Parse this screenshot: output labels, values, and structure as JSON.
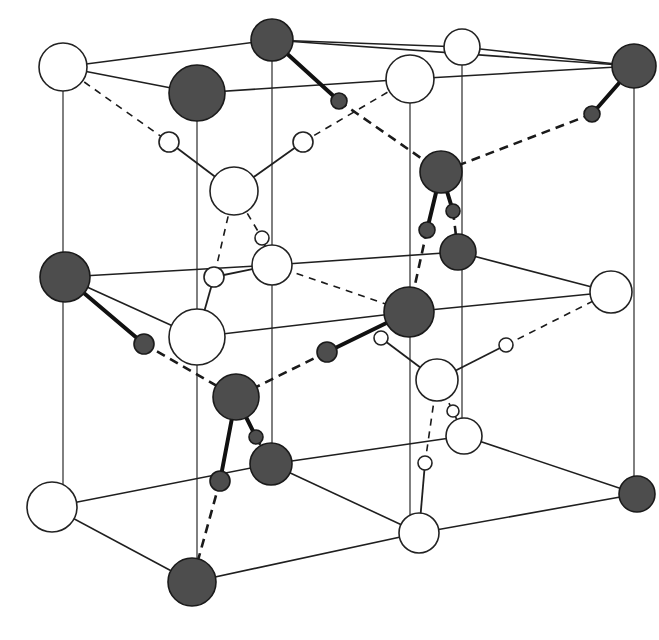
{
  "figure": {
    "legend_colors": {
      "dark_atom": "#4d4d4d",
      "light_atom": "#ffffff",
      "line": "#1f1f1f"
    }
  },
  "atoms": {
    "large": [
      {
        "id": "W1",
        "x": 63,
        "y": 67,
        "r": 24,
        "type": "light"
      },
      {
        "id": "D1",
        "x": 272,
        "y": 40,
        "r": 21,
        "type": "dark"
      },
      {
        "id": "D2",
        "x": 197,
        "y": 93,
        "r": 28,
        "type": "dark"
      },
      {
        "id": "W2",
        "x": 462,
        "y": 47,
        "r": 18,
        "type": "light"
      },
      {
        "id": "W3",
        "x": 410,
        "y": 79,
        "r": 24,
        "type": "light"
      },
      {
        "id": "D3",
        "x": 634,
        "y": 66,
        "r": 22,
        "type": "dark"
      },
      {
        "id": "W4",
        "x": 234,
        "y": 191,
        "r": 24,
        "type": "light"
      },
      {
        "id": "D4",
        "x": 441,
        "y": 172,
        "r": 21,
        "type": "dark"
      },
      {
        "id": "D5",
        "x": 458,
        "y": 252,
        "r": 18,
        "type": "dark"
      },
      {
        "id": "W5",
        "x": 272,
        "y": 265,
        "r": 20,
        "type": "light"
      },
      {
        "id": "D6",
        "x": 65,
        "y": 277,
        "r": 25,
        "type": "dark"
      },
      {
        "id": "W6",
        "x": 197,
        "y": 337,
        "r": 28,
        "type": "light"
      },
      {
        "id": "D7",
        "x": 409,
        "y": 312,
        "r": 25,
        "type": "dark"
      },
      {
        "id": "W7",
        "x": 611,
        "y": 292,
        "r": 21,
        "type": "light"
      },
      {
        "id": "W8",
        "x": 437,
        "y": 380,
        "r": 21,
        "type": "light"
      },
      {
        "id": "D8",
        "x": 236,
        "y": 397,
        "r": 23,
        "type": "dark"
      },
      {
        "id": "W9",
        "x": 464,
        "y": 436,
        "r": 18,
        "type": "light"
      },
      {
        "id": "D9",
        "x": 271,
        "y": 464,
        "r": 21,
        "type": "dark"
      },
      {
        "id": "W10",
        "x": 52,
        "y": 507,
        "r": 25,
        "type": "light"
      },
      {
        "id": "D10",
        "x": 637,
        "y": 494,
        "r": 18,
        "type": "dark"
      },
      {
        "id": "W11",
        "x": 419,
        "y": 533,
        "r": 20,
        "type": "light"
      },
      {
        "id": "D11",
        "x": 192,
        "y": 582,
        "r": 24,
        "type": "dark"
      }
    ],
    "small": [
      {
        "id": "h1",
        "x": 339,
        "y": 101,
        "r": 8,
        "type": "dark"
      },
      {
        "id": "h2",
        "x": 592,
        "y": 114,
        "r": 8,
        "type": "dark"
      },
      {
        "id": "h3",
        "x": 453,
        "y": 211,
        "r": 7,
        "type": "dark"
      },
      {
        "id": "h4",
        "x": 427,
        "y": 230,
        "r": 8,
        "type": "dark"
      },
      {
        "id": "h5",
        "x": 144,
        "y": 344,
        "r": 10,
        "type": "dark"
      },
      {
        "id": "h6",
        "x": 327,
        "y": 352,
        "r": 10,
        "type": "dark"
      },
      {
        "id": "h7",
        "x": 256,
        "y": 437,
        "r": 7,
        "type": "dark"
      },
      {
        "id": "h8",
        "x": 220,
        "y": 481,
        "r": 10,
        "type": "dark"
      },
      {
        "id": "h9",
        "x": 169,
        "y": 142,
        "r": 10,
        "type": "light"
      },
      {
        "id": "h10",
        "x": 303,
        "y": 142,
        "r": 10,
        "type": "light"
      },
      {
        "id": "h11",
        "x": 262,
        "y": 238,
        "r": 7,
        "type": "light"
      },
      {
        "id": "h12",
        "x": 214,
        "y": 277,
        "r": 10,
        "type": "light"
      },
      {
        "id": "h13",
        "x": 381,
        "y": 338,
        "r": 7,
        "type": "light"
      },
      {
        "id": "h14",
        "x": 506,
        "y": 345,
        "r": 7,
        "type": "light"
      },
      {
        "id": "h15",
        "x": 453,
        "y": 411,
        "r": 6,
        "type": "light"
      },
      {
        "id": "h16",
        "x": 425,
        "y": 463,
        "r": 7,
        "type": "light"
      }
    ]
  },
  "lines": {
    "lattice_edges": [
      [
        63,
        67,
        272,
        40
      ],
      [
        63,
        67,
        197,
        93
      ],
      [
        272,
        40,
        462,
        47
      ],
      [
        272,
        40,
        634,
        66
      ],
      [
        197,
        93,
        410,
        79
      ],
      [
        462,
        47,
        634,
        66
      ],
      [
        410,
        79,
        634,
        66
      ],
      [
        65,
        277,
        272,
        265
      ],
      [
        65,
        277,
        197,
        337
      ],
      [
        272,
        265,
        458,
        252
      ],
      [
        197,
        337,
        409,
        312
      ],
      [
        409,
        312,
        611,
        292
      ],
      [
        458,
        252,
        611,
        292
      ],
      [
        52,
        507,
        271,
        464
      ],
      [
        52,
        507,
        192,
        582
      ],
      [
        271,
        464,
        464,
        436
      ],
      [
        271,
        464,
        419,
        533
      ],
      [
        192,
        582,
        419,
        533
      ],
      [
        464,
        436,
        637,
        494
      ],
      [
        419,
        533,
        637,
        494
      ],
      [
        0,
        0,
        0,
        0
      ]
    ],
    "verticals": [
      [
        63,
        91,
        63,
        507
      ],
      [
        197,
        121,
        197,
        582
      ],
      [
        272,
        61,
        272,
        464
      ],
      [
        410,
        103,
        410,
        533
      ],
      [
        462,
        65,
        462,
        436
      ],
      [
        634,
        88,
        634,
        494
      ]
    ],
    "covalent": [
      [
        272,
        40,
        339,
        101
      ],
      [
        634,
        66,
        592,
        114
      ],
      [
        441,
        172,
        427,
        230
      ],
      [
        441,
        172,
        453,
        211
      ],
      [
        65,
        277,
        144,
        344
      ],
      [
        409,
        312,
        327,
        352
      ],
      [
        236,
        397,
        220,
        481
      ],
      [
        236,
        397,
        256,
        437
      ]
    ],
    "covalent_thin": [
      [
        234,
        191,
        169,
        142
      ],
      [
        234,
        191,
        303,
        142
      ],
      [
        272,
        265,
        262,
        238
      ],
      [
        272,
        265,
        214,
        277
      ],
      [
        437,
        380,
        381,
        338
      ],
      [
        437,
        380,
        506,
        345
      ],
      [
        464,
        436,
        453,
        411
      ],
      [
        419,
        533,
        425,
        463
      ],
      [
        197,
        337,
        214,
        277
      ]
    ],
    "hbond_thick": [
      [
        339,
        101,
        441,
        172
      ],
      [
        592,
        114,
        441,
        172
      ],
      [
        427,
        230,
        409,
        312
      ],
      [
        453,
        211,
        458,
        252
      ],
      [
        144,
        344,
        236,
        397
      ],
      [
        327,
        352,
        236,
        397
      ],
      [
        256,
        437,
        271,
        464
      ],
      [
        220,
        481,
        192,
        582
      ]
    ],
    "hbond_thin": [
      [
        63,
        67,
        169,
        142
      ],
      [
        303,
        142,
        410,
        79
      ],
      [
        234,
        191,
        214,
        277
      ],
      [
        234,
        191,
        262,
        238
      ],
      [
        272,
        265,
        409,
        312
      ],
      [
        381,
        338,
        409,
        312
      ],
      [
        506,
        345,
        611,
        292
      ],
      [
        437,
        380,
        425,
        463
      ],
      [
        437,
        380,
        453,
        411
      ]
    ]
  }
}
